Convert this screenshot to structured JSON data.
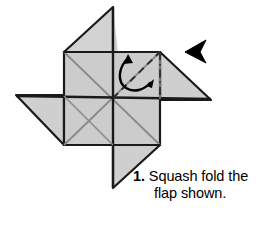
{
  "figure": {
    "paper_fill": "#cccccc",
    "paper_fill_light": "#d4d4d4",
    "paper_fill_dark": "#c2c2c2",
    "outline_color": "#1a1a1a",
    "crease_color": "#8a8a8a",
    "fold_line_color": "#2b2b2b",
    "background": "#ffffff",
    "arrow_color": "#000000",
    "pointer_color": "#000000"
  },
  "caption": {
    "step_number": "1.",
    "line_1": "Squash fold the",
    "line_2": "flap shown."
  },
  "annotations": {
    "valley_fold_label": "dashed-valley-fold-line",
    "axis_label": "dash-dot-center-line",
    "curved_arrow_label": "squash-fold-curved-arrow",
    "pointer_label": "flap-pointer-arrowhead"
  },
  "geometry": {
    "center": {
      "x": 113,
      "y": 98
    },
    "square": {
      "left": 64,
      "top": 52,
      "right": 160,
      "bottom": 145
    },
    "wing_top_tip": {
      "x": 113,
      "y": 7
    },
    "wing_right_tip": {
      "x": 211,
      "y": 100
    },
    "wing_bottom_tip": {
      "x": 113,
      "y": 188
    },
    "wing_left_tip": {
      "x": 16,
      "y": 95
    }
  }
}
